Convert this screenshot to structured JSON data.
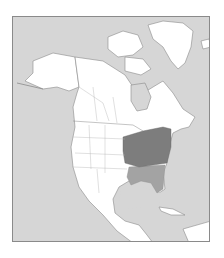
{
  "map": {
    "type": "species-range-map",
    "region": "North America",
    "colors": {
      "ocean": "#d6d6d6",
      "land": "#ffffff",
      "border": "#8a8a8a",
      "range_core": "#7d7d7d",
      "range_secondary": "#a3a3a3",
      "frame": "#8a8a8a"
    },
    "legend": null
  }
}
